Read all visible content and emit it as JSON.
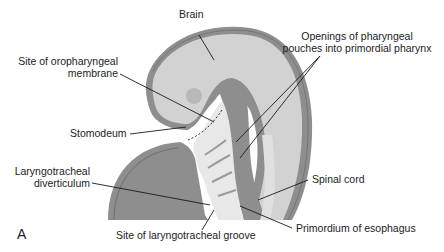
{
  "figure": {
    "panel_label": "A",
    "labels": {
      "brain": "Brain",
      "oropharyngeal_line1": "Site of oropharyngeal",
      "oropharyngeal_line2": "membrane",
      "pouches_line1": "Openings of pharyngeal",
      "pouches_line2": "pouches into primordial pharynx",
      "stomodeum": "Stomodeum",
      "laryngo_line1": "Laryngotracheal",
      "laryngo_line2": "diverticulum",
      "spinal_cord": "Spinal cord",
      "esophagus": "Primordium of esophagus",
      "groove": "Site of laryngotracheal groove"
    },
    "colors": {
      "outer_wall": "#8e8e8e",
      "inner_tissue": "#d2d2d2",
      "pharynx": "#e8e8e8",
      "heart": "#8a8a8a",
      "eye": "#b8b8b8",
      "leader": "#1a1a1a"
    }
  }
}
